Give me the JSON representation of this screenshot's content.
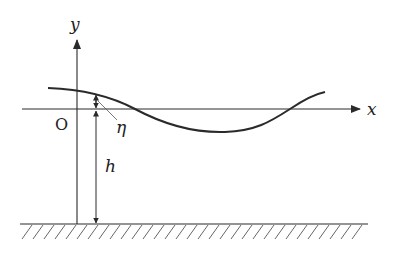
{
  "diagram": {
    "labels": {
      "y_axis": "y",
      "x_axis": "x",
      "origin": "O",
      "eta": "η",
      "depth": "h"
    },
    "colors": {
      "stroke": "#2a2a2a",
      "background": "#ffffff"
    }
  }
}
